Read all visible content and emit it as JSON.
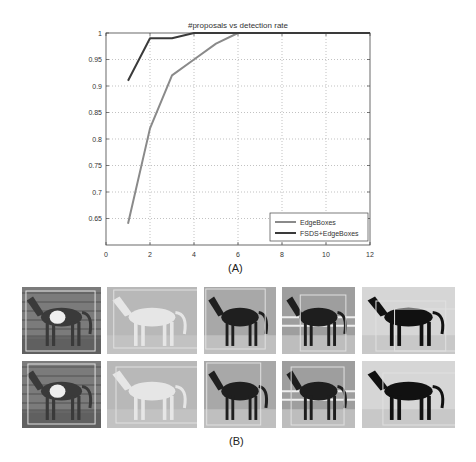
{
  "chart_data": {
    "type": "line",
    "title": "#proposals vs detection rate",
    "xlabel": "",
    "ylabel": "",
    "xlim": [
      0,
      12
    ],
    "ylim": [
      0.6,
      1.0
    ],
    "x_ticks": [
      "0",
      "2",
      "4",
      "6",
      "8",
      "10",
      "12"
    ],
    "y_ticks": [
      "0.65",
      "0.7",
      "0.75",
      "0.8",
      "0.85",
      "0.9",
      "0.95",
      "1"
    ],
    "grid": true,
    "legend_position": "lower right",
    "series": [
      {
        "name": "EdgeBoxes",
        "color": "#8a8a8a",
        "x": [
          1,
          2,
          3,
          4,
          5,
          6,
          7,
          8,
          9,
          10,
          11,
          12
        ],
        "values": [
          0.64,
          0.82,
          0.92,
          0.95,
          0.98,
          1.0,
          1.0,
          1.0,
          1.0,
          1.0,
          1.0,
          1.0
        ]
      },
      {
        "name": "FSDS+EdgeBoxes",
        "color": "#3a3a3a",
        "x": [
          1,
          2,
          3,
          4,
          5,
          6,
          7,
          8,
          9,
          10,
          11,
          12
        ],
        "values": [
          0.91,
          0.99,
          0.99,
          1.0,
          1.0,
          1.0,
          1.0,
          1.0,
          1.0,
          1.0,
          1.0,
          1.0
        ]
      }
    ]
  },
  "labels": {
    "panel_a": "(A)",
    "panel_b": "(B)"
  },
  "image_grid": {
    "rows": [
      {
        "description": "EdgeBoxes proposals",
        "images": [
          {
            "subject": "pinto horse standing"
          },
          {
            "subject": "white horse galloping"
          },
          {
            "subject": "dark horse standing"
          },
          {
            "subject": "dark horse by fence"
          },
          {
            "subject": "black horse trotting"
          }
        ]
      },
      {
        "description": "FSDS+EdgeBoxes proposals",
        "images": [
          {
            "subject": "pinto horse standing"
          },
          {
            "subject": "white horse galloping"
          },
          {
            "subject": "dark horse standing"
          },
          {
            "subject": "dark horse by fence"
          },
          {
            "subject": "black horse trotting"
          }
        ]
      }
    ]
  }
}
